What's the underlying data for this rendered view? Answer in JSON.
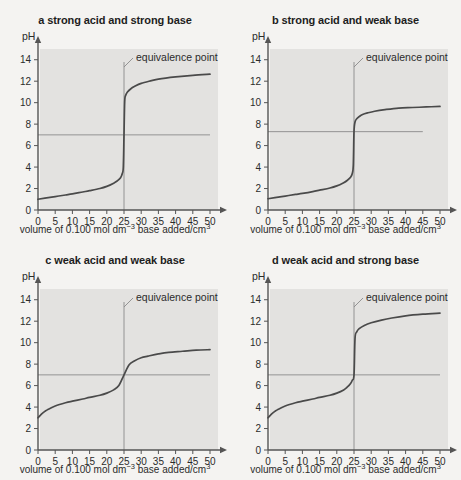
{
  "figure": {
    "background": "#f4f3f1",
    "plot_background": "#e3e2e0",
    "curve_color": "#4a4a4a",
    "axis_color": "#555555",
    "reference_line_color": "#8a8a8a"
  },
  "common": {
    "ylabel": "pH",
    "xlabel_main": "volume of 0.100 mol dm",
    "xlabel_exp": "−3",
    "xlabel_tail": " base added/cm",
    "xlabel_tail_exp": "3",
    "annotation": "equivalence point",
    "x_ticks": [
      "0",
      "5",
      "10",
      "15",
      "20",
      "25",
      "30",
      "35",
      "40",
      "45",
      "50"
    ],
    "y_ticks": [
      "0",
      "2",
      "4",
      "6",
      "8",
      "10",
      "12",
      "14"
    ]
  },
  "chart_data": [
    {
      "type": "line",
      "id": "a",
      "title": "a strong acid and strong base",
      "xlabel": "volume of 0.100 mol dm⁻³ base added/cm³",
      "ylabel": "pH",
      "xlim": [
        0,
        50
      ],
      "ylim": [
        0,
        15
      ],
      "xticks": [
        0,
        5,
        10,
        15,
        20,
        25,
        30,
        35,
        40,
        45,
        50
      ],
      "yticks": [
        0,
        2,
        4,
        6,
        8,
        10,
        12,
        14
      ],
      "grid": false,
      "legend": "none",
      "equivalence_point": {
        "x": 25,
        "pH": 7,
        "label": "equivalence point"
      },
      "reference_line": {
        "pH": 7.0,
        "x_start": 0,
        "x_end": 50
      },
      "series": [
        {
          "name": "titration curve a",
          "x": [
            0,
            2,
            5,
            8,
            10,
            13,
            15,
            18,
            20,
            22,
            23,
            24,
            24.5,
            24.8,
            25,
            25.2,
            25.5,
            26,
            27,
            28,
            30,
            33,
            35,
            40,
            45,
            50
          ],
          "y": [
            1.0,
            1.1,
            1.25,
            1.4,
            1.5,
            1.68,
            1.8,
            2.0,
            2.2,
            2.5,
            2.7,
            3.0,
            3.4,
            4.0,
            7.0,
            10.1,
            10.7,
            11.0,
            11.3,
            11.5,
            11.8,
            12.05,
            12.2,
            12.4,
            12.55,
            12.65
          ]
        }
      ]
    },
    {
      "type": "line",
      "id": "b",
      "title": "b strong acid and weak base",
      "xlabel": "volume of 0.100 mol dm⁻³ base added/cm³",
      "ylabel": "pH",
      "xlim": [
        0,
        50
      ],
      "ylim": [
        0,
        15
      ],
      "xticks": [
        0,
        5,
        10,
        15,
        20,
        25,
        30,
        35,
        40,
        45,
        50
      ],
      "yticks": [
        0,
        2,
        4,
        6,
        8,
        10,
        12,
        14
      ],
      "grid": false,
      "legend": "none",
      "equivalence_point": {
        "x": 25,
        "pH": 7.3,
        "label": "equivalence point"
      },
      "reference_line": {
        "pH": 7.3,
        "x_start": 0,
        "x_end": 45
      },
      "series": [
        {
          "name": "titration curve b",
          "x": [
            0,
            2,
            5,
            8,
            10,
            13,
            15,
            18,
            20,
            22,
            23,
            24,
            24.5,
            24.8,
            25,
            25.3,
            25.8,
            26.5,
            27.5,
            29,
            31,
            34,
            38,
            42,
            46,
            50
          ],
          "y": [
            1.05,
            1.15,
            1.3,
            1.45,
            1.55,
            1.72,
            1.85,
            2.05,
            2.25,
            2.55,
            2.75,
            3.05,
            3.4,
            4.2,
            7.3,
            8.2,
            8.5,
            8.7,
            8.9,
            9.05,
            9.2,
            9.35,
            9.5,
            9.55,
            9.6,
            9.65
          ]
        }
      ]
    },
    {
      "type": "line",
      "id": "c",
      "title": "c weak acid and weak base",
      "xlabel": "volume of 0.100 mol dm⁻³ base added/cm³",
      "ylabel": "pH",
      "xlim": [
        0,
        50
      ],
      "ylim": [
        0,
        15
      ],
      "xticks": [
        0,
        5,
        10,
        15,
        20,
        25,
        30,
        35,
        40,
        45,
        50
      ],
      "yticks": [
        0,
        2,
        4,
        6,
        8,
        10,
        12,
        14
      ],
      "grid": false,
      "legend": "none",
      "equivalence_point": {
        "x": 25,
        "pH": 7.0,
        "label": "equivalence point"
      },
      "reference_line": {
        "pH": 7.0,
        "x_start": 0,
        "x_end": 50
      },
      "series": [
        {
          "name": "titration curve c",
          "x": [
            0,
            1,
            2,
            3,
            5,
            8,
            10,
            13,
            15,
            18,
            20,
            22,
            23.5,
            25,
            26.5,
            28,
            30,
            32,
            35,
            38,
            42,
            46,
            50
          ],
          "y": [
            3.0,
            3.35,
            3.6,
            3.8,
            4.1,
            4.4,
            4.55,
            4.75,
            4.9,
            5.1,
            5.3,
            5.6,
            6.0,
            7.0,
            7.95,
            8.3,
            8.6,
            8.75,
            8.95,
            9.1,
            9.2,
            9.3,
            9.35
          ]
        }
      ]
    },
    {
      "type": "line",
      "id": "d",
      "title": "d weak acid and strong base",
      "xlabel": "volume of 0.100 mol dm⁻³ base added/cm³",
      "ylabel": "pH",
      "xlim": [
        0,
        50
      ],
      "ylim": [
        0,
        15
      ],
      "xticks": [
        0,
        5,
        10,
        15,
        20,
        25,
        30,
        35,
        40,
        45,
        50
      ],
      "yticks": [
        0,
        2,
        4,
        6,
        8,
        10,
        12,
        14
      ],
      "grid": false,
      "legend": "none",
      "equivalence_point": {
        "x": 25,
        "pH": 7.0,
        "label": "equivalence point"
      },
      "reference_line": {
        "pH": 7.0,
        "x_start": 0,
        "x_end": 50
      },
      "series": [
        {
          "name": "titration curve d",
          "x": [
            0,
            1,
            2,
            3,
            5,
            8,
            10,
            13,
            15,
            18,
            20,
            22,
            23,
            24,
            24.5,
            25,
            25.3,
            25.8,
            26.5,
            28,
            30,
            33,
            36,
            40,
            45,
            50
          ],
          "y": [
            3.0,
            3.35,
            3.6,
            3.8,
            4.1,
            4.4,
            4.55,
            4.75,
            4.9,
            5.1,
            5.3,
            5.6,
            5.85,
            6.2,
            6.5,
            7.0,
            10.4,
            11.0,
            11.3,
            11.6,
            11.85,
            12.1,
            12.3,
            12.5,
            12.65,
            12.75
          ]
        }
      ]
    }
  ]
}
